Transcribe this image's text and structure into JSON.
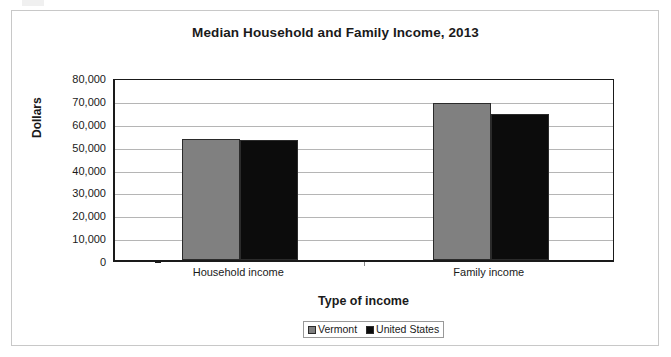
{
  "chart_data": {
    "type": "bar",
    "title": "Median Household and Family Income, 2013",
    "xlabel": "Type of income",
    "ylabel": "Dollars",
    "categories": [
      "Household income",
      "Family income"
    ],
    "series": [
      {
        "name": "Vermont",
        "color": "#808080",
        "values": [
          52700,
          68600
        ]
      },
      {
        "name": "United States",
        "color": "#0c0c0c",
        "values": [
          52300,
          63800
        ]
      }
    ],
    "ylim": [
      0,
      80000
    ],
    "ytick_values": [
      80000,
      70000,
      60000,
      50000,
      40000,
      30000,
      20000,
      10000,
      0
    ],
    "ytick_labels": [
      "80,000",
      "70,000",
      "60,000",
      "50,000",
      "40,000",
      "30,000",
      "20,000",
      "10,000",
      "0"
    ],
    "grid": true,
    "legend_position": "bottom"
  },
  "legend": {
    "items": [
      {
        "label": "Vermont"
      },
      {
        "label": "United States"
      }
    ]
  }
}
